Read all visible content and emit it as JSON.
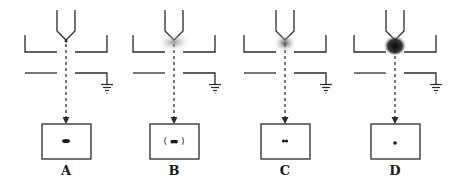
{
  "diagram": {
    "type": "electrospray/ion-source stages schematic",
    "panels": [
      {
        "id": "A",
        "label": "A",
        "cx": 66,
        "spray": "none",
        "spot": "elongated-dash",
        "spot_text": ""
      },
      {
        "id": "B",
        "label": "B",
        "cx": 174,
        "spray": "light-dispersed",
        "spot": "dash-in-parens",
        "spot_text": "(▬)"
      },
      {
        "id": "C",
        "label": "C",
        "cx": 285,
        "spray": "moderate-cone",
        "spot": "small-cluster",
        "spot_text": ""
      },
      {
        "id": "D",
        "label": "D",
        "cx": 395,
        "spray": "dense-dark-cone",
        "spot": "point",
        "spot_text": ""
      }
    ],
    "components": [
      "nozzle",
      "upper-plate",
      "lower-plate",
      "ground-symbol",
      "dashed-beam-arrow",
      "detector-box"
    ],
    "colors": {
      "line": "#2a2a2a",
      "background": "#ffffff"
    }
  }
}
